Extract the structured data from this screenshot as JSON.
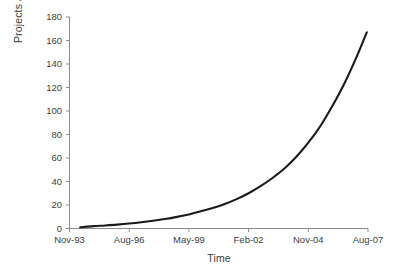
{
  "chart_data": {
    "type": "line",
    "title": "",
    "xlabel": "Time",
    "ylabel": "Projects added",
    "grid": false,
    "legend": "none",
    "series_color": "#1a1a1a",
    "axis_color": "#8c8c8c",
    "text_color": "#3d3d3d",
    "ylim": [
      0,
      180
    ],
    "y_ticks": [
      0,
      20,
      40,
      60,
      80,
      100,
      120,
      140,
      160,
      180
    ],
    "y_tick_labels": [
      "0",
      "20",
      "40",
      "60",
      "80",
      "100",
      "120",
      "140",
      "160",
      "180"
    ],
    "x_tick_labels": [
      "Nov-93",
      "Aug-96",
      "May-99",
      "Feb-02",
      "Nov-04",
      "Aug-07"
    ],
    "x_tick_positions": [
      0,
      1,
      2,
      3,
      4,
      5
    ],
    "xlim": [
      0,
      5
    ],
    "series": [
      {
        "name": "Projects added",
        "x": [
          0.18,
          0.4,
          0.6,
          0.8,
          1.0,
          1.2,
          1.4,
          1.6,
          1.8,
          2.0,
          2.2,
          2.4,
          2.6,
          2.8,
          3.0,
          3.2,
          3.4,
          3.6,
          3.8,
          4.0,
          4.2,
          4.4,
          4.6,
          4.8,
          4.98
        ],
        "values": [
          1,
          2,
          2.6,
          3.3,
          4.2,
          5.3,
          6.6,
          8.1,
          9.9,
          12,
          14.6,
          17.5,
          20.9,
          25,
          30,
          36,
          43,
          51,
          61,
          73,
          87,
          104,
          123,
          145,
          167
        ]
      }
    ],
    "annotations": []
  },
  "figure": {
    "y_axis_title": "Projects added",
    "x_axis_title": "Time"
  }
}
